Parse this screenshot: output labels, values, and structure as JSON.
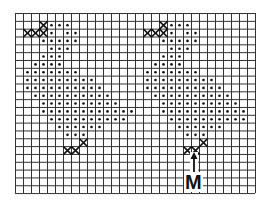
{
  "figure": {
    "grid": {
      "cols": 30,
      "rows": 23,
      "left": 15,
      "top": 13,
      "cell_w": 8,
      "cell_h": 7.83,
      "line_color": "#333333",
      "background": "#ffffff"
    },
    "dot_color": "#111111",
    "cross_color": "#111111",
    "patterns": [
      {
        "name": "left-pattern",
        "dots": {
          "1": [
            4,
            5,
            6
          ],
          "2": [
            4,
            6,
            7
          ],
          "3": [
            3,
            4,
            5,
            6,
            7
          ],
          "4": [
            4,
            5,
            6
          ],
          "5": [
            3,
            4,
            5
          ],
          "6": [
            2,
            3,
            4,
            5
          ],
          "7": [
            1,
            2,
            3,
            4,
            5,
            6,
            7
          ],
          "8": [
            1,
            2,
            3,
            4,
            5,
            6,
            7,
            8,
            9
          ],
          "9": [
            1,
            2,
            3,
            4,
            5,
            6,
            7,
            8,
            9,
            10
          ],
          "10": [
            2,
            3,
            4,
            5,
            6,
            7,
            8,
            9,
            10,
            11
          ],
          "11": [
            3,
            4,
            5,
            6,
            7,
            8,
            9,
            10,
            11,
            12
          ],
          "12": [
            3,
            4,
            5,
            6,
            7,
            8,
            9,
            10,
            11,
            12,
            13,
            14
          ],
          "13": [
            4,
            5,
            6,
            7,
            8,
            9,
            10,
            11,
            12,
            13
          ],
          "14": [
            5,
            6,
            7,
            8,
            9,
            10
          ],
          "15": [
            6,
            7,
            8
          ]
        },
        "crosses": [
          {
            "row": 2,
            "cols": [
              1,
              2,
              3
            ],
            "rising_col": 3,
            "rising_row": 1
          },
          {
            "row": 17,
            "cols": [
              6,
              7
            ],
            "rising_col": 8,
            "rising_row": 16
          }
        ]
      },
      {
        "name": "right-pattern",
        "dots": {
          "1": [
            19,
            20,
            21
          ],
          "2": [
            19,
            21,
            22
          ],
          "3": [
            18,
            19,
            20,
            21,
            22
          ],
          "4": [
            19,
            20,
            21
          ],
          "5": [
            18,
            19,
            20
          ],
          "6": [
            17,
            18,
            19,
            20
          ],
          "7": [
            16,
            17,
            18,
            19,
            20,
            21,
            22
          ],
          "8": [
            16,
            17,
            18,
            19,
            20,
            21,
            22,
            23,
            24
          ],
          "9": [
            16,
            17,
            18,
            19,
            20,
            21,
            22,
            23,
            24,
            25
          ],
          "10": [
            17,
            18,
            19,
            20,
            21,
            22,
            23,
            24,
            25,
            26
          ],
          "11": [
            18,
            19,
            20,
            21,
            22,
            23,
            24,
            25,
            26,
            27
          ],
          "12": [
            18,
            19,
            20,
            21,
            22,
            23,
            24,
            25,
            26,
            27,
            28
          ],
          "13": [
            19,
            20,
            21,
            22,
            23,
            24,
            25,
            26,
            27,
            28
          ],
          "14": [
            20,
            21,
            22,
            23,
            24,
            25
          ],
          "15": [
            21,
            22,
            23
          ]
        },
        "crosses": [
          {
            "row": 2,
            "cols": [
              16,
              17,
              18
            ],
            "rising_col": 18,
            "rising_row": 1
          },
          {
            "row": 17,
            "cols": [
              21,
              22
            ],
            "rising_col": 23,
            "rising_row": 16
          }
        ]
      }
    ],
    "marker": {
      "label": "M",
      "arrow_x": 194,
      "arrow_top": 152,
      "arrow_bottom": 172,
      "label_x": 184,
      "label_y": 172,
      "font_size": 20
    }
  }
}
